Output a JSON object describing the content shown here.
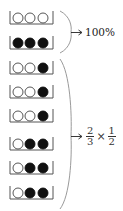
{
  "trays": [
    {
      "state": [
        "empty",
        "empty",
        "empty"
      ]
    },
    {
      "state": [
        "filled",
        "filled",
        "filled"
      ]
    },
    {
      "state": [
        "empty",
        "empty",
        "filled"
      ]
    },
    {
      "state": [
        "empty",
        "empty",
        "filled"
      ]
    },
    {
      "state": [
        "empty",
        "empty",
        "filled"
      ]
    },
    {
      "state": [
        "empty",
        "filled",
        "filled"
      ]
    },
    {
      "state": [
        "empty",
        "filled",
        "filled"
      ]
    },
    {
      "state": [
        "empty",
        "filled",
        "filled"
      ]
    }
  ],
  "groups": [
    {
      "label": "100%"
    },
    {
      "fraction_a": {
        "num": "2",
        "den": "3"
      },
      "operator": "×",
      "fraction_b": {
        "num": "1",
        "den": "2"
      }
    }
  ],
  "colors": {
    "ink": "#222222",
    "brace": "#9a9a9a"
  }
}
